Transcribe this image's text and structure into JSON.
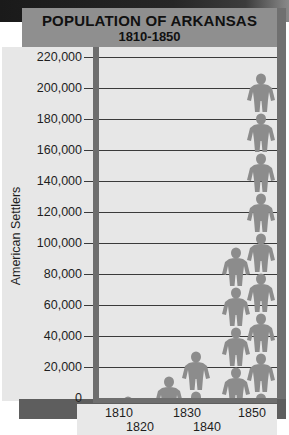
{
  "chart_data": {
    "type": "bar",
    "style": "pictograph",
    "title": "POPULATION OF ARKANSAS",
    "subtitle": "1810-1850",
    "xlabel": "",
    "ylabel": "American Settlers",
    "categories": [
      "1810",
      "1820",
      "1830",
      "1840",
      "1850"
    ],
    "values": [
      1062,
      14273,
      30388,
      97574,
      209897
    ],
    "ylim": [
      0,
      220000
    ],
    "yticks": [
      "220,000",
      "200,000",
      "180,000",
      "160,000",
      "140,000",
      "120,000",
      "100,000",
      "80,000",
      "60,000",
      "40,000",
      "20,000",
      "0"
    ],
    "grid": true,
    "legend": "none",
    "pictogram_unit": "person figure",
    "colors": {
      "figure": "#8c8c8c",
      "header": "#8f8f8f",
      "axis": "#6e6e6e",
      "panel": "#e7e7e7"
    }
  },
  "header": {
    "title": "POPULATION OF ARKANSAS",
    "subtitle": "1810-1850"
  },
  "axis": {
    "y_title": "American Settlers",
    "y_ticks": [
      "220,000",
      "200,000",
      "180,000",
      "160,000",
      "140,000",
      "120,000",
      "100,000",
      "80,000",
      "60,000",
      "40,000",
      "20,000",
      "0"
    ],
    "x_ticks": [
      "1810",
      "1820",
      "1830",
      "1840",
      "1850"
    ]
  }
}
